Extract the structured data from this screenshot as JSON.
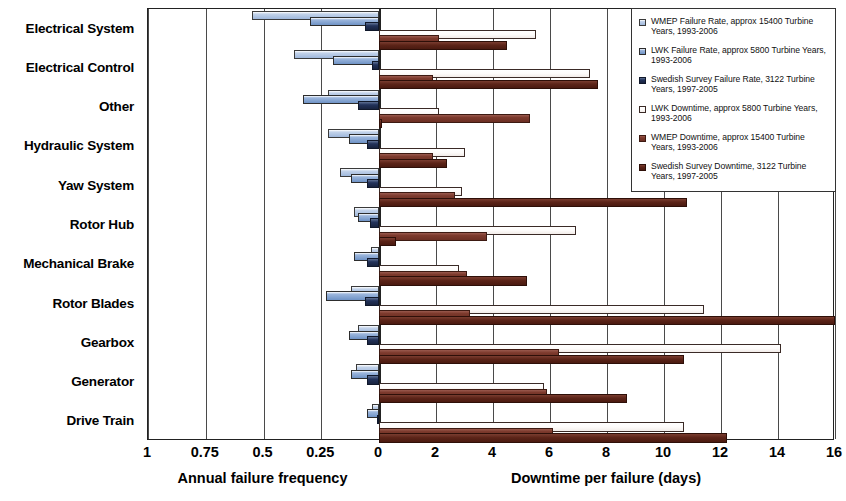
{
  "chart_data": {
    "type": "bar",
    "orientation": "horizontal-diverging",
    "title": "",
    "categories": [
      "Electrical System",
      "Electrical Control",
      "Other",
      "Hydraulic System",
      "Yaw System",
      "Rotor Hub",
      "Mechanical Brake",
      "Rotor Blades",
      "Gearbox",
      "Generator",
      "Drive Train"
    ],
    "left_axis": {
      "label": "Annual failure frequency",
      "ticks": [
        "1",
        "0.75",
        "0.5",
        "0.25",
        "0"
      ],
      "tick_values": [
        1,
        0.75,
        0.5,
        0.25,
        0
      ],
      "range": [
        1,
        0
      ],
      "direction": "reversed"
    },
    "right_axis": {
      "label": "Downtime per failure (days)",
      "ticks": [
        "0",
        "2",
        "4",
        "6",
        "8",
        "10",
        "12",
        "14",
        "16"
      ],
      "tick_values": [
        0,
        2,
        4,
        6,
        8,
        10,
        12,
        14,
        16
      ],
      "range": [
        0,
        16
      ]
    },
    "grid": true,
    "legend_position": "top-right",
    "series": [
      {
        "name": "WMEP Failure Rate, approx 15400 Turbine Years, 1993-2006",
        "short": "WMEP Failure Rate",
        "axis": "left",
        "color": "#b9cde8",
        "values": [
          0.55,
          0.37,
          0.22,
          0.22,
          0.17,
          0.11,
          0.035,
          0.12,
          0.09,
          0.1,
          0.03
        ]
      },
      {
        "name": "LWK Failure Rate, approx 5800 Turbine Years, 1993-2006",
        "short": "LWK Failure Rate",
        "axis": "left",
        "color": "#7f9fd0",
        "values": [
          0.3,
          0.2,
          0.33,
          0.13,
          0.12,
          0.09,
          0.11,
          0.23,
          0.13,
          0.12,
          0.05
        ]
      },
      {
        "name": "Swedish Survey Failure Rate, 3122 Turbine Years, 1997-2005",
        "short": "Swedish Survey Failure Rate",
        "axis": "left",
        "color": "#1e2e52",
        "values": [
          0.06,
          0.03,
          0.09,
          0.05,
          0.05,
          0.04,
          0.05,
          0.06,
          0.05,
          0.05,
          0.01
        ]
      },
      {
        "name": "LWK Downtime, approx 5800 Turbine Years, 1993-2006",
        "short": "LWK Downtime",
        "axis": "right",
        "color": "#f7f2ef",
        "values": [
          5.5,
          7.4,
          2.1,
          3.0,
          2.9,
          6.9,
          2.8,
          11.4,
          14.1,
          5.8,
          10.7
        ]
      },
      {
        "name": "WMEP Downtime, approx 15400 Turbine Years, 1993-2006",
        "short": "WMEP Downtime",
        "axis": "right",
        "color": "#7d3a2d",
        "values": [
          2.1,
          1.9,
          5.3,
          1.9,
          2.65,
          3.8,
          3.1,
          3.2,
          6.3,
          5.9,
          6.1
        ]
      },
      {
        "name": "Swedish Survey Downtime, 3122 Turbine Years, 1997-2005",
        "short": "Swedish Survey Downtime",
        "axis": "right",
        "color": "#5c2418",
        "values": [
          4.5,
          7.7,
          0.1,
          2.4,
          10.8,
          0.6,
          5.2,
          16.0,
          10.7,
          8.7,
          12.2
        ]
      }
    ]
  },
  "legend": {
    "items": [
      {
        "label": "WMEP Failure Rate, approx 15400 Turbine Years, 1993-2006",
        "swatch": "s-wmep-fr"
      },
      {
        "label": "LWK Failure Rate, approx 5800 Turbine Years, 1993-2006",
        "swatch": "s-lwk-fr"
      },
      {
        "label": "Swedish Survey Failure Rate, 3122 Turbine Years, 1997-2005",
        "swatch": "s-swed-fr"
      },
      {
        "label": "LWK Downtime, approx 5800 Turbine Years, 1993-2006",
        "swatch": "s-lwk-dt"
      },
      {
        "label": "WMEP Downtime, approx 15400 Turbine Years, 1993-2006",
        "swatch": "s-wmep-dt"
      },
      {
        "label": "Swedish Survey Downtime, 3122 Turbine Years, 1997-2005",
        "swatch": "s-swed-dt"
      }
    ]
  }
}
